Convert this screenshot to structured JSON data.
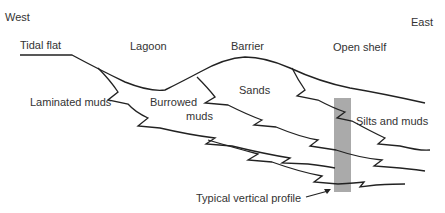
{
  "diagram": {
    "directions": {
      "west": "West",
      "east": "East"
    },
    "environments": {
      "tidal_flat": "Tidal flat",
      "lagoon": "Lagoon",
      "barrier": "Barrier",
      "open_shelf": "Open shelf"
    },
    "facies": {
      "laminated_muds": "Laminated muds",
      "burrowed_muds_line1": "Burrowed",
      "burrowed_muds_line2": "muds",
      "sands": "Sands",
      "silts_and_muds": "Silts and muds"
    },
    "annotation": "Typical vertical profile",
    "colors": {
      "line": "#222222",
      "profile_bar": "#aaaaaa",
      "text": "#333333"
    }
  }
}
